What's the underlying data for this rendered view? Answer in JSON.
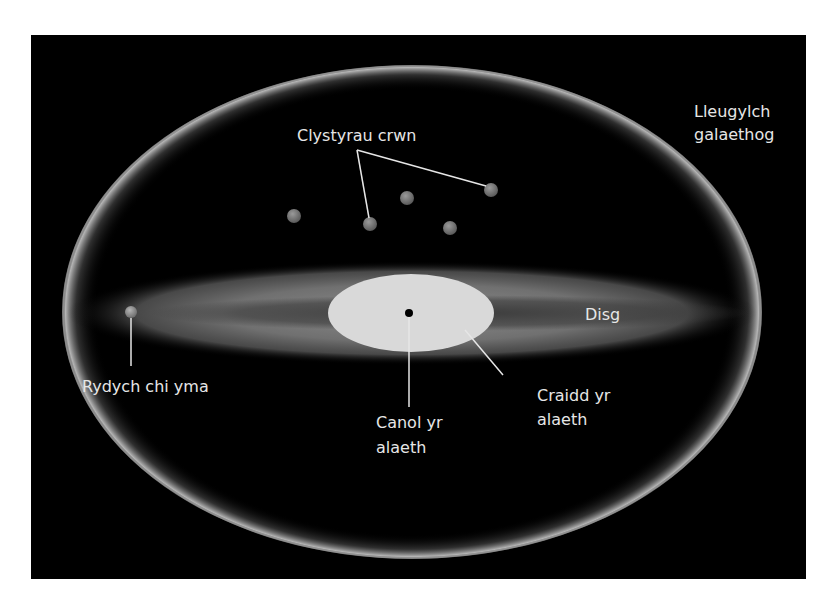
{
  "diagram": {
    "type": "galaxy-structure",
    "background_color": "#000000",
    "labels": {
      "halo_line1": "Lleugylch",
      "halo_line2": "galaethog",
      "clusters": "Clystyrau crwn",
      "disc": "Disg",
      "you_are_here": "Rydych chi yma",
      "centre_line1": "Canol yr",
      "centre_line2": "alaeth",
      "core_line1": "Craidd yr",
      "core_line2": "alaeth"
    },
    "colors": {
      "halo_edge": "#bfbfbf",
      "disc": "#8a8a8a",
      "core": "#d9d9d9",
      "cluster": "#7a7a7a",
      "centre_dot": "#000000",
      "leader_line": "#e6e6e6"
    },
    "globular_clusters_count": 5
  }
}
